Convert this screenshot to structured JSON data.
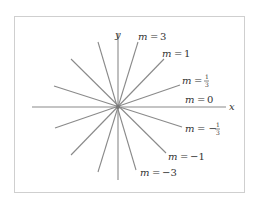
{
  "diagram": {
    "axes": {
      "x_label": "x",
      "y_label": "y"
    },
    "line_color": "#8a8a8a",
    "slopes": [
      {
        "m": "3",
        "label_var": "m",
        "label_eq": "=",
        "label_val": "3"
      },
      {
        "m": "1",
        "label_var": "m",
        "label_eq": "=",
        "label_val": "1"
      },
      {
        "m": "1/3",
        "label_var": "m",
        "label_eq": "=",
        "label_num": "1",
        "label_den": "3"
      },
      {
        "m": "0",
        "label_var": "m",
        "label_eq": "=",
        "label_val": "0"
      },
      {
        "m": "-1/3",
        "label_var": "m",
        "label_eq": "= −",
        "label_num": "1",
        "label_den": "3"
      },
      {
        "m": "-1",
        "label_var": "m",
        "label_eq": "=",
        "label_val": "−1"
      },
      {
        "m": "-3",
        "label_var": "m",
        "label_eq": "=",
        "label_val": "−3"
      }
    ]
  }
}
